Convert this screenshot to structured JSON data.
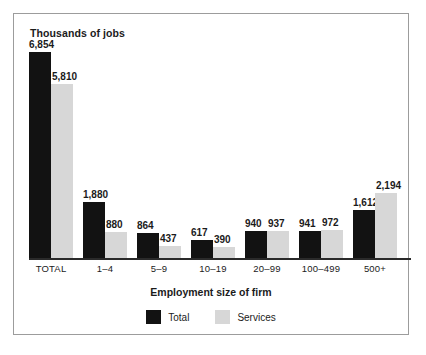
{
  "chart_data": {
    "type": "bar",
    "title": "Thousands of jobs",
    "xlabel": "Employment size of firm",
    "ylabel": "Thousands of jobs",
    "grid": false,
    "legend_position": "bottom",
    "ylim": [
      0,
      6854
    ],
    "categories": [
      "TOTAL",
      "1–4",
      "5–9",
      "10–19",
      "20–99",
      "100–499",
      "500+"
    ],
    "series": [
      {
        "name": "Total",
        "color": "#121212",
        "values": [
          6854,
          1880,
          864,
          617,
          940,
          941,
          1612
        ],
        "labels": [
          "6,854",
          "1,880",
          "864",
          "617",
          "940",
          "941",
          "1,612"
        ]
      },
      {
        "name": "Services",
        "color": "#d7d7d7",
        "values": [
          5810,
          880,
          437,
          390,
          937,
          972,
          2194
        ],
        "labels": [
          "5,810",
          "880",
          "437",
          "390",
          "937",
          "972",
          "2,194"
        ]
      }
    ]
  },
  "legend": {
    "items": [
      {
        "label": "Total",
        "color": "#121212"
      },
      {
        "label": "Services",
        "color": "#d7d7d7"
      }
    ]
  },
  "frame": {
    "border_color": "#9c9c9c",
    "background": "#ffffff"
  }
}
